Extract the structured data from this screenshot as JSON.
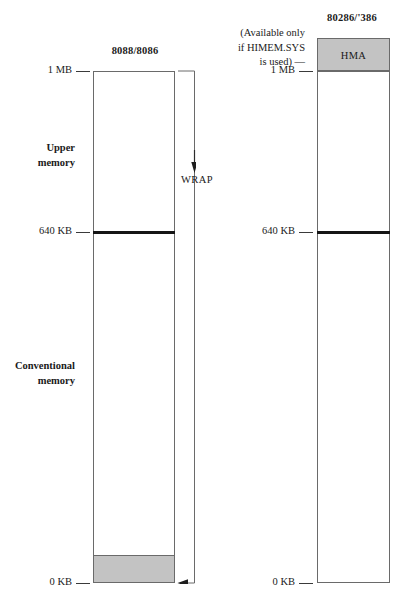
{
  "figure": {
    "type": "memory-map-diagram",
    "background": "#ffffff",
    "gray_fill": "#c3c3c3",
    "line_color": "#6a6a6a",
    "rule_color": "#151515"
  },
  "left_column": {
    "title": "8088/8086",
    "ticks": [
      {
        "label": "1 MB",
        "y": 71
      },
      {
        "label": "640 KB",
        "y": 232
      },
      {
        "label": "0 KB",
        "y": 583
      }
    ],
    "regions": [
      {
        "name": "upper-memory",
        "label": "Upper\nmemory",
        "line1": "Upper",
        "line2": "memory"
      },
      {
        "name": "conventional-memory",
        "label": "Conventional\nmemory",
        "line1": "Conventional",
        "line2": "memory"
      }
    ],
    "bottom_block": {
      "label": "",
      "filled": true
    }
  },
  "right_column": {
    "title": "80286/'386",
    "ticks": [
      {
        "label": "1 MB",
        "y": 71
      },
      {
        "label": "640 KB",
        "y": 232
      },
      {
        "label": "0 KB",
        "y": 583
      }
    ],
    "hma_block": {
      "label": "HMA",
      "filled": true
    }
  },
  "annotations": {
    "himem_note": {
      "line1": "(Available  only",
      "line2": "if HIMEM.SYS",
      "line3": "is used) —"
    },
    "wrap": {
      "label": "WRAP"
    }
  }
}
